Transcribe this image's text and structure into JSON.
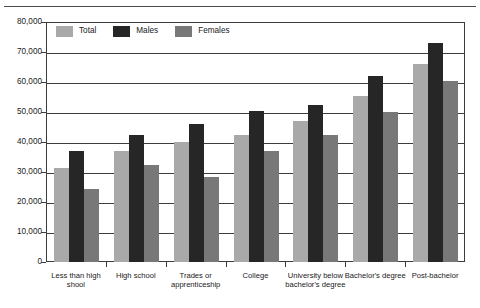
{
  "chart_data": {
    "type": "bar",
    "title": "",
    "xlabel": "",
    "ylabel": "",
    "ylim": [
      0,
      80000
    ],
    "ytick_values": [
      0,
      10000,
      20000,
      30000,
      40000,
      50000,
      60000,
      70000,
      80000
    ],
    "ytick_labels": [
      "0",
      "10,000",
      "20,000",
      "30,000",
      "40,000",
      "50,000",
      "60,000",
      "70,000",
      "80,000"
    ],
    "grid": true,
    "legend_position": "top-left",
    "categories": [
      "Less than high shool",
      "High school",
      "Trades or apprenticeship",
      "College",
      "University below bachelor's degree",
      "Bachelor's degree",
      "Post-bachelor"
    ],
    "series": [
      {
        "name": "Total",
        "color": "#a9a9a9",
        "values": [
          31500,
          37000,
          40000,
          42500,
          47000,
          55500,
          66000
        ]
      },
      {
        "name": "Males",
        "color": "#262626",
        "values": [
          37000,
          42500,
          46000,
          50500,
          52500,
          62000,
          73000
        ]
      },
      {
        "name": "Females",
        "color": "#787878",
        "values": [
          24500,
          32500,
          28500,
          37000,
          42500,
          50000,
          60500
        ]
      }
    ]
  }
}
